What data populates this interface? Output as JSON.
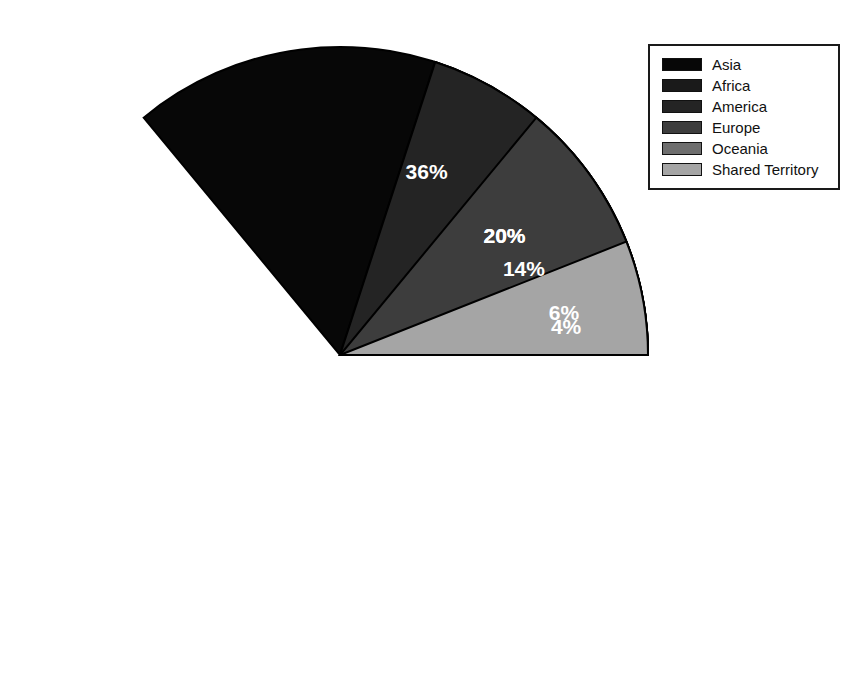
{
  "chart_data": {
    "type": "pie",
    "title": "",
    "subtitle": "",
    "xlabel": "",
    "ylabel": "",
    "grid": false,
    "legend_position": "top-right",
    "start_angle_deg": 0,
    "direction": "counterclockwise",
    "value_unit": "%",
    "labels": [
      "Asia",
      "Africa",
      "America",
      "Europe",
      "Oceania",
      "Shared Territory"
    ],
    "values": [
      36,
      20,
      20,
      14,
      4,
      6
    ],
    "value_labels": [
      "36%",
      "20%",
      "20%",
      "14%",
      "4%",
      "6%"
    ],
    "colors": [
      "#070707",
      "#1a1a1a",
      "#242424",
      "#3d3d3d",
      "#6e6e6e",
      "#a5a5a5"
    ],
    "slices": [
      {
        "label": "Asia",
        "value": 36,
        "display": "36%",
        "color": "#070707"
      },
      {
        "label": "Africa",
        "value": 20,
        "display": "20%",
        "color": "#1a1a1a"
      },
      {
        "label": "America",
        "value": 20,
        "display": "20%",
        "color": "#242424"
      },
      {
        "label": "Europe",
        "value": 14,
        "display": "14%",
        "color": "#3d3d3d"
      },
      {
        "label": "Oceania",
        "value": 4,
        "display": "4%",
        "color": "#6e6e6e"
      },
      {
        "label": "Shared Territory",
        "value": 6,
        "display": "6%",
        "color": "#a5a5a5"
      }
    ]
  },
  "pie": {
    "center_x": 310,
    "center_y": 310,
    "radius": 308,
    "outline_color": "#000000",
    "label_color": "#ffffff"
  },
  "legend": {
    "border_color": "#1a1a1a",
    "background": "#ffffff",
    "items": [
      {
        "label": "Asia",
        "color": "#070707"
      },
      {
        "label": "Africa",
        "color": "#1a1a1a"
      },
      {
        "label": "America",
        "color": "#242424"
      },
      {
        "label": "Europe",
        "color": "#3d3d3d"
      },
      {
        "label": "Oceania",
        "color": "#6e6e6e"
      },
      {
        "label": "Shared Territory",
        "color": "#a5a5a5"
      }
    ]
  }
}
